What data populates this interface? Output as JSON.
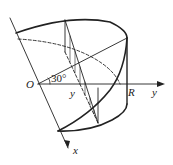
{
  "diagram": {
    "labels": {
      "origin": "O",
      "angle": "30°",
      "y_inner": "y",
      "radius": "R",
      "y_axis": "y",
      "x_axis": "x"
    },
    "colors": {
      "stroke": "#222222",
      "background": "#ffffff"
    }
  }
}
